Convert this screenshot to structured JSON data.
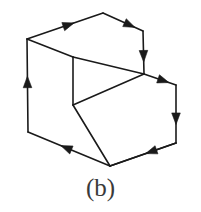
{
  "figure": {
    "label": "(b)",
    "kind": "oriented-step-solid-diagram",
    "stroke_color": "#1a1a1a",
    "caption_color": "#3a3a3a",
    "background_color": "#ffffff",
    "stroke_width": 1.6,
    "vertices": {
      "A": [
        27,
        39
      ],
      "B": [
        103,
        13
      ],
      "C": [
        143,
        31
      ],
      "D": [
        73,
        57
      ],
      "E": [
        144,
        74
      ],
      "F": [
        176,
        85
      ],
      "G": [
        73,
        105
      ],
      "H": [
        110,
        166
      ],
      "I": [
        176,
        143
      ],
      "J": [
        28,
        132
      ]
    },
    "directed_edges": [
      {
        "name": "edge-A-B",
        "from": "A",
        "to": "B",
        "arrow_at": 0.62,
        "arrow": "true"
      },
      {
        "name": "edge-B-C",
        "from": "B",
        "to": "C",
        "arrow_at": 0.8,
        "arrow": "true"
      },
      {
        "name": "edge-C-E",
        "from": "C",
        "to": "E",
        "arrow_at": 0.72,
        "arrow": "true"
      },
      {
        "name": "edge-E-F",
        "from": "E",
        "to": "F",
        "arrow_at": 0.78,
        "arrow": "true"
      },
      {
        "name": "edge-F-I",
        "from": "F",
        "to": "I",
        "arrow_at": 0.68,
        "arrow": "true"
      },
      {
        "name": "edge-I-H",
        "from": "I",
        "to": "H",
        "arrow_at": 0.46,
        "arrow": "true"
      },
      {
        "name": "edge-H-J",
        "from": "H",
        "to": "J",
        "arrow_at": 0.6,
        "arrow": "true"
      },
      {
        "name": "edge-J-A",
        "from": "J",
        "to": "A",
        "arrow_at": 0.6,
        "arrow": "true"
      }
    ],
    "plain_edges": [
      {
        "name": "edge-A-D",
        "from": "A",
        "to": "D"
      },
      {
        "name": "edge-D-E",
        "from": "D",
        "to": "E"
      },
      {
        "name": "edge-D-G",
        "from": "D",
        "to": "G"
      },
      {
        "name": "edge-G-H",
        "from": "G",
        "to": "H"
      },
      {
        "name": "edge-G-E",
        "from": "G",
        "to": "E"
      },
      {
        "name": "edge-H-I",
        "from": "H",
        "to": "I"
      }
    ]
  }
}
